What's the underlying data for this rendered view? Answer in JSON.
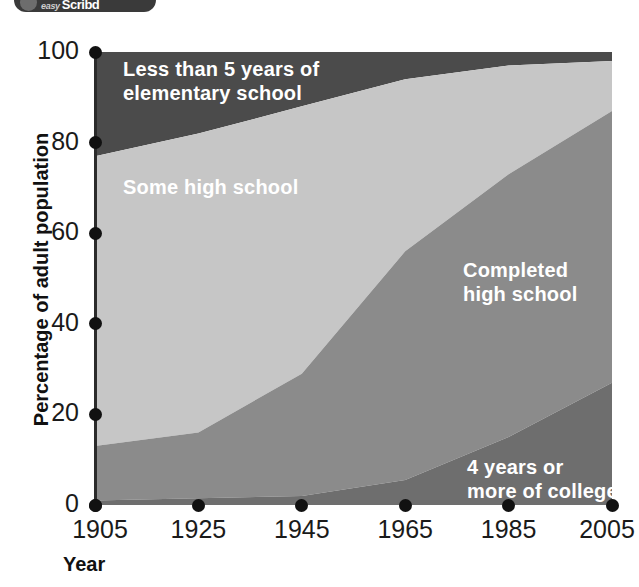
{
  "logo": {
    "icon": "circle-logo-icon",
    "line1": "easy",
    "line2": "Scribd"
  },
  "chart_data": {
    "type": "area",
    "stacked": true,
    "title": "",
    "subtitle": "",
    "xlabel": "Year",
    "ylabel": "Percentage of adult population",
    "x": [
      1905,
      1925,
      1945,
      1965,
      1985,
      2005
    ],
    "xtick_labels": [
      "1905",
      "1925",
      "1945",
      "1965",
      "1985",
      "2005"
    ],
    "ytick_labels": [
      "0",
      "20",
      "40",
      "60",
      "80",
      "100"
    ],
    "ytick_values": [
      0,
      20,
      40,
      60,
      80,
      100
    ],
    "xlim": [
      1905,
      2005
    ],
    "ylim": [
      0,
      100
    ],
    "grid": false,
    "legend_position": "inline-annotations",
    "series": [
      {
        "name": "4 years or more of college",
        "color": "#6e6e6e",
        "values": [
          1,
          1.5,
          2,
          5.5,
          15,
          27
        ]
      },
      {
        "name": "Completed high school",
        "color": "#8b8b8b",
        "values": [
          12,
          14.5,
          27,
          50.5,
          58,
          60
        ]
      },
      {
        "name": "Some high school",
        "color": "#c6c6c6",
        "values": [
          64,
          66,
          59,
          38,
          24,
          11
        ]
      },
      {
        "name": "Less than 5 years of elementary school",
        "color": "#4b4b4b",
        "values": [
          23,
          18,
          12,
          6,
          3,
          2
        ]
      }
    ],
    "cumulative_tops": {
      "college": [
        1,
        1.5,
        2,
        5.5,
        15,
        27
      ],
      "completed_high_school": [
        13,
        16,
        29,
        56,
        73,
        87
      ],
      "some_high_school": [
        77,
        82,
        88,
        94,
        97,
        98
      ],
      "less_than_5_years": [
        100,
        100,
        100,
        100,
        100,
        100
      ]
    },
    "annotations": [
      {
        "name": "less-than-5-years-label",
        "text_line1": "Less than 5 years of",
        "text_line2": "elementary school"
      },
      {
        "name": "some-high-school-label",
        "text_line1": "Some high school",
        "text_line2": ""
      },
      {
        "name": "completed-high-school-label",
        "text_line1": "Completed",
        "text_line2": "high school"
      },
      {
        "name": "college-label",
        "text_line1": "4 years or",
        "text_line2": "more of college"
      }
    ],
    "colors": {
      "less_than_5_years": "#4b4b4b",
      "some_high_school": "#c6c6c6",
      "completed_high_school": "#8b8b8b",
      "college": "#6e6e6e",
      "axis": "#2b2b2b",
      "tick_dot": "#111111",
      "label_text": "#ffffff"
    }
  }
}
